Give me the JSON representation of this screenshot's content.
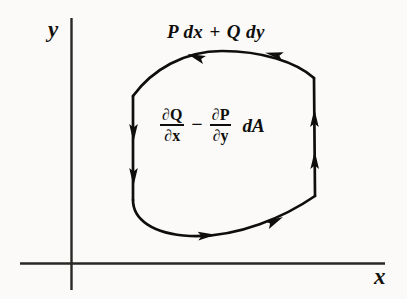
{
  "figure": {
    "kind": "greens-theorem-diagram",
    "axes": {
      "x_label": "x",
      "y_label": "y",
      "origin": [
        71,
        264
      ],
      "x_axis": [
        20,
        264,
        385,
        264
      ],
      "y_axis": [
        71,
        18,
        71,
        290
      ]
    },
    "line_integral": {
      "p_term": "P dx",
      "operator": "+",
      "q_term": "Q dy",
      "full": "P dx + Q dy"
    },
    "double_integral": {
      "first_fraction": {
        "numerator": "∂Q",
        "denominator": "∂x"
      },
      "operator": "−",
      "second_fraction": {
        "numerator": "∂P",
        "denominator": "∂y"
      },
      "area_element": "dA",
      "full": "∂Q/∂x − ∂P/∂y  dA"
    },
    "curve": {
      "orientation": "counterclockwise",
      "stroke_color": "#100e0c",
      "stroke_width": 2.6,
      "arrow_count": 6,
      "arrow_directions": [
        "left",
        "left",
        "down",
        "down",
        "right",
        "right",
        "up",
        "up"
      ]
    },
    "colors": {
      "ink": "#100e0c",
      "axis": "#2a2724",
      "background": "#fbfaf8"
    }
  }
}
